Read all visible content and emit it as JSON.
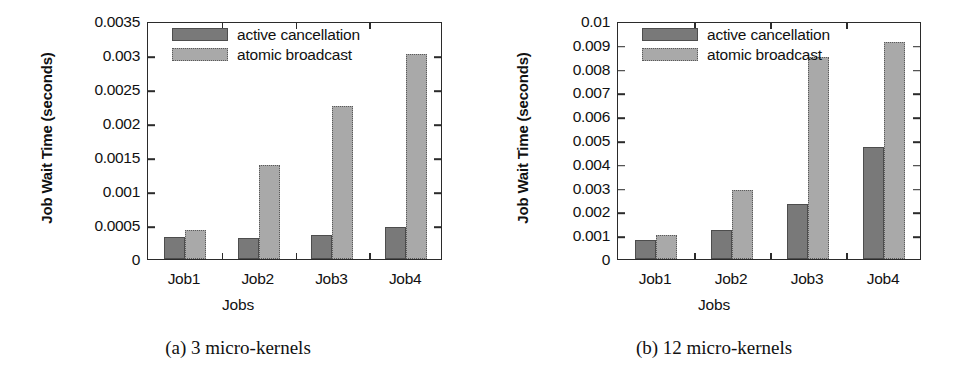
{
  "figure": {
    "panels": [
      {
        "id": "panel-a",
        "caption": "(a)  3 micro-kernels",
        "axis_title_y": "Job Wait Time (seconds)",
        "axis_title_x": "Jobs",
        "yticks": [
          "0",
          "0.0005",
          "0.001",
          "0.0015",
          "0.002",
          "0.0025",
          "0.003",
          "0.0035"
        ],
        "xticks": [
          "Job1",
          "Job2",
          "Job3",
          "Job4"
        ],
        "legend": [
          {
            "key": "ac",
            "label": "active cancellation",
            "color": "#797979"
          },
          {
            "key": "ab",
            "label": "atomic broadcast",
            "color": "#a9a9a9"
          }
        ]
      },
      {
        "id": "panel-b",
        "caption": "(b)  12 micro-kernels",
        "axis_title_y": "Job Wait Time (seconds)",
        "axis_title_x": "Jobs",
        "yticks": [
          "0",
          "0.001",
          "0.002",
          "0.003",
          "0.004",
          "0.005",
          "0.006",
          "0.007",
          "0.008",
          "0.009",
          "0.01"
        ],
        "xticks": [
          "Job1",
          "Job2",
          "Job3",
          "Job4"
        ],
        "legend": [
          {
            "key": "ac",
            "label": "active cancellation",
            "color": "#797979"
          },
          {
            "key": "ab",
            "label": "atomic broadcast",
            "color": "#a9a9a9"
          }
        ]
      }
    ]
  },
  "chart_data": [
    {
      "type": "bar",
      "title": "(a)  3 micro-kernels",
      "xlabel": "Jobs",
      "ylabel": "Job Wait Time (seconds)",
      "categories": [
        "Job1",
        "Job2",
        "Job3",
        "Job4"
      ],
      "series": [
        {
          "name": "active cancellation",
          "color": "#797979",
          "values": [
            0.00032,
            0.00031,
            0.00035,
            0.00047
          ]
        },
        {
          "name": "atomic broadcast",
          "color": "#a9a9a9",
          "values": [
            0.00043,
            0.00138,
            0.00225,
            0.00302
          ]
        }
      ],
      "ylim": [
        0,
        0.0035
      ],
      "ytick_step": 0.0005,
      "grid": false,
      "legend_position": "top-left-inside"
    },
    {
      "type": "bar",
      "title": "(b)  12 micro-kernels",
      "xlabel": "Jobs",
      "ylabel": "Job Wait Time (seconds)",
      "categories": [
        "Job1",
        "Job2",
        "Job3",
        "Job4"
      ],
      "series": [
        {
          "name": "active cancellation",
          "color": "#797979",
          "values": [
            0.00078,
            0.0012,
            0.00232,
            0.0047
          ]
        },
        {
          "name": "atomic broadcast",
          "color": "#a9a9a9",
          "values": [
            0.00101,
            0.00292,
            0.0085,
            0.0091
          ]
        }
      ],
      "ylim": [
        0,
        0.01
      ],
      "ytick_step": 0.001,
      "grid": false,
      "legend_position": "top-left-inside"
    }
  ]
}
